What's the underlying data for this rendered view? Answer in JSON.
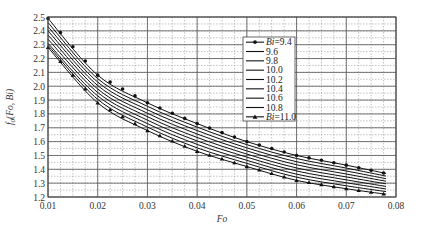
{
  "chart_data": {
    "type": "line",
    "title": "",
    "xlabel": "Fo",
    "ylabel": "f0(Fo,Bi)",
    "xlim": [
      0.01,
      0.08
    ],
    "ylim": [
      1.2,
      2.5
    ],
    "xticks": [
      "0.01",
      "0.02",
      "0.03",
      "0.04",
      "0.05",
      "0.06",
      "0.07",
      "0.08"
    ],
    "yticks": [
      "1.2",
      "1.3",
      "1.4",
      "1.5",
      "1.6",
      "1.7",
      "1.8",
      "1.9",
      "2.0",
      "2.1",
      "2.2",
      "2.3",
      "2.4",
      "2.5"
    ],
    "grid": true,
    "legend_position": "upper right (inside)",
    "x": [
      0.01,
      0.02,
      0.03,
      0.04,
      0.05,
      0.06,
      0.07,
      0.078
    ],
    "series": [
      {
        "name": "Bi=9.4",
        "marker": "circle",
        "values": [
          2.49,
          2.08,
          1.88,
          1.73,
          1.6,
          1.5,
          1.43,
          1.37
        ]
      },
      {
        "name": "9.6",
        "marker": "none",
        "values": [
          2.46,
          2.055,
          1.855,
          1.705,
          1.578,
          1.478,
          1.409,
          1.351
        ]
      },
      {
        "name": "9.8",
        "marker": "none",
        "values": [
          2.43,
          2.03,
          1.83,
          1.68,
          1.555,
          1.455,
          1.388,
          1.332
        ]
      },
      {
        "name": "10.0",
        "marker": "none",
        "values": [
          2.4,
          2.005,
          1.805,
          1.655,
          1.533,
          1.433,
          1.366,
          1.314
        ]
      },
      {
        "name": "10.2",
        "marker": "none",
        "values": [
          2.37,
          1.98,
          1.78,
          1.63,
          1.51,
          1.41,
          1.345,
          1.295
        ]
      },
      {
        "name": "10.4",
        "marker": "none",
        "values": [
          2.34,
          1.955,
          1.755,
          1.605,
          1.488,
          1.388,
          1.324,
          1.276
        ]
      },
      {
        "name": "10.6",
        "marker": "none",
        "values": [
          2.31,
          1.93,
          1.73,
          1.58,
          1.465,
          1.365,
          1.303,
          1.258
        ]
      },
      {
        "name": "10.8",
        "marker": "none",
        "values": [
          2.295,
          1.905,
          1.705,
          1.555,
          1.443,
          1.343,
          1.281,
          1.239
        ]
      },
      {
        "name": "Bi=11.0",
        "marker": "triangle",
        "values": [
          2.28,
          1.88,
          1.68,
          1.53,
          1.42,
          1.32,
          1.26,
          1.22
        ]
      }
    ]
  },
  "legend": {
    "items": [
      {
        "prefix": "Bi",
        "label": "=9.4",
        "marker": "circle"
      },
      {
        "prefix": "",
        "label": "9.6",
        "marker": "none"
      },
      {
        "prefix": "",
        "label": "9.8",
        "marker": "none"
      },
      {
        "prefix": "",
        "label": "10.0",
        "marker": "none"
      },
      {
        "prefix": "",
        "label": "10.2",
        "marker": "none"
      },
      {
        "prefix": "",
        "label": "10.4",
        "marker": "none"
      },
      {
        "prefix": "",
        "label": "10.6",
        "marker": "none"
      },
      {
        "prefix": "",
        "label": "10.8",
        "marker": "none"
      },
      {
        "prefix": "Bi",
        "label": "=11.0",
        "marker": "triangle"
      }
    ]
  },
  "colors": {
    "line": "#111111",
    "major_grid": "#555555",
    "minor_grid": "#888888",
    "axis": "#444444"
  }
}
